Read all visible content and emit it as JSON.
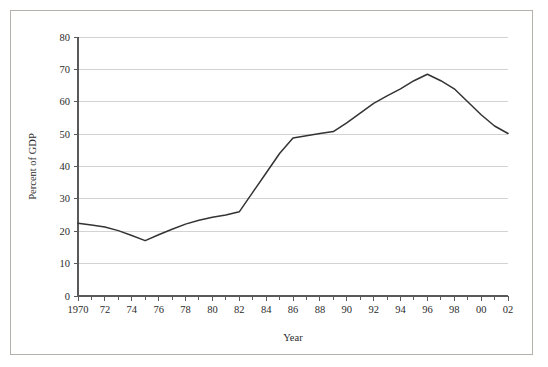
{
  "chart_data": {
    "type": "line",
    "title": "",
    "subtitle": "",
    "xlabel": "Year",
    "ylabel": "Percent of GDP",
    "xlim": [
      1970,
      2002
    ],
    "ylim": [
      0,
      80
    ],
    "grid": true,
    "grid_axis": "y",
    "legend": false,
    "legend_position": "none",
    "x_tick_labels": [
      "1970",
      "72",
      "74",
      "76",
      "78",
      "80",
      "82",
      "84",
      "86",
      "88",
      "90",
      "92",
      "94",
      "96",
      "98",
      "00",
      "02"
    ],
    "x_tick_values": [
      1970,
      1972,
      1974,
      1976,
      1978,
      1980,
      1982,
      1984,
      1986,
      1988,
      1990,
      1992,
      1994,
      1996,
      1998,
      2000,
      2002
    ],
    "x_minor_tick_interval": 1,
    "y_tick_labels": [
      "0",
      "10",
      "20",
      "30",
      "40",
      "50",
      "60",
      "70",
      "80"
    ],
    "y_tick_values": [
      0,
      10,
      20,
      30,
      40,
      50,
      60,
      70,
      80
    ],
    "series": [
      {
        "name": "Percent of GDP",
        "color": "#333333",
        "line_width": 1.5,
        "x": [
          1970,
          1971,
          1972,
          1973,
          1974,
          1975,
          1976,
          1977,
          1978,
          1979,
          1980,
          1981,
          1982,
          1983,
          1984,
          1985,
          1986,
          1987,
          1988,
          1989,
          1990,
          1991,
          1992,
          1993,
          1994,
          1995,
          1996,
          1997,
          1998,
          1999,
          2000,
          2001,
          2002
        ],
        "values": [
          22.5,
          21.9,
          21.3,
          20.2,
          18.7,
          17.1,
          18.9,
          20.6,
          22.2,
          23.4,
          24.3,
          25.0,
          26.0,
          32.0,
          38.0,
          44.0,
          48.8,
          49.5,
          50.2,
          50.8,
          53.5,
          56.5,
          59.5,
          61.8,
          64.0,
          66.5,
          68.5,
          66.5,
          64.0,
          60.0,
          56.0,
          52.5,
          50.2
        ]
      }
    ]
  },
  "axis": {
    "y_label": "Percent of GDP",
    "x_label": "Year"
  },
  "colors": {
    "line": "#333333",
    "grid": "#c8c8c8",
    "axis": "#595959",
    "frame": "#b4b0ab",
    "text": "#2b2b2b"
  }
}
